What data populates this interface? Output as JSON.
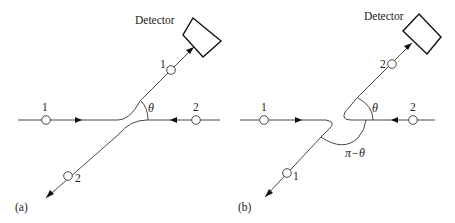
{
  "panels": [
    {
      "id": "a",
      "caption": "(a)",
      "detector_label": "Detector",
      "incoming_left_label": "1",
      "incoming_right_label": "2",
      "outgoing_upper_label": "1",
      "outgoing_lower_label": "2",
      "angle_label": "θ"
    },
    {
      "id": "b",
      "caption": "(b)",
      "detector_label": "Detector",
      "incoming_left_label": "1",
      "incoming_right_label": "2",
      "outgoing_upper_label": "2",
      "outgoing_lower_label": "1",
      "angle_label": "θ",
      "supplementary_angle_label": "π−θ"
    }
  ],
  "colors": {
    "line": "#333333",
    "background": "#ffffff"
  }
}
